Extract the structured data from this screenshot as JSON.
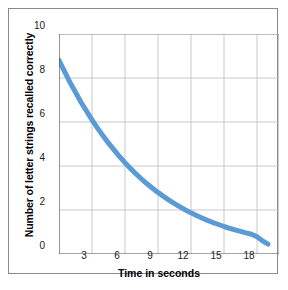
{
  "figure": {
    "background_color": "#ffffff",
    "frame_color": "#8a8a8a"
  },
  "chart_data": {
    "type": "line",
    "title": "",
    "subtitle": "",
    "xlabel": "Time in seconds",
    "ylabel": "Number of letter strings recalled correctly",
    "xlim": [
      0,
      20
    ],
    "ylim": [
      0,
      10
    ],
    "grid": true,
    "legend": "none",
    "line_color": "#5B9BD5",
    "line_width": 5,
    "xticks": [
      3,
      6,
      9,
      12,
      15,
      18
    ],
    "xtick_labels": [
      "3",
      "6",
      "9",
      "12",
      "15",
      "18"
    ],
    "yticks": [
      0,
      2,
      4,
      6,
      8,
      10
    ],
    "ytick_labels": [
      "0",
      "2",
      "4",
      "6",
      "8",
      "10"
    ],
    "series": [
      {
        "name": "Letter strings recalled",
        "x": [
          0,
          0.5,
          1,
          1.5,
          2,
          2.5,
          3,
          3.5,
          4,
          4.5,
          5,
          5.5,
          6,
          6.5,
          7,
          7.5,
          8,
          8.5,
          9,
          9.5,
          10,
          10.5,
          11,
          11.5,
          12,
          12.5,
          13,
          13.5,
          14,
          14.5,
          15,
          15.5,
          16,
          16.5,
          17,
          17.5,
          18,
          18.5,
          19
        ],
        "y": [
          8.8,
          8.3,
          7.8,
          7.35,
          6.9,
          6.5,
          6.1,
          5.72,
          5.37,
          5.04,
          4.73,
          4.43,
          4.15,
          3.89,
          3.64,
          3.41,
          3.19,
          2.99,
          2.8,
          2.62,
          2.45,
          2.29,
          2.14,
          2.0,
          1.87,
          1.75,
          1.64,
          1.53,
          1.43,
          1.34,
          1.25,
          1.17,
          1.1,
          1.03,
          0.96,
          0.9,
          0.78,
          0.6,
          0.45
        ]
      }
    ],
    "annotations": []
  }
}
